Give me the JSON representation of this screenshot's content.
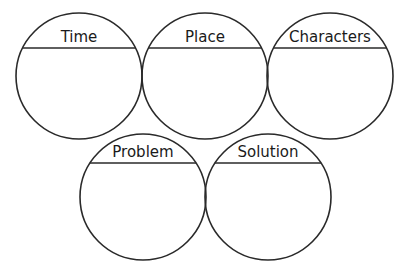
{
  "circles": [
    {
      "label": "Time",
      "row": "top",
      "position": "left"
    },
    {
      "label": "Place",
      "row": "top",
      "position": "center"
    },
    {
      "label": "Characters",
      "row": "top",
      "position": "right"
    },
    {
      "label": "Problem",
      "row": "bottom",
      "position": "left"
    },
    {
      "label": "Solution",
      "row": "bottom",
      "position": "right"
    }
  ],
  "colors": {
    "stroke": "#2a2a2a",
    "background": "#ffffff",
    "text": "#1a1a1a"
  }
}
